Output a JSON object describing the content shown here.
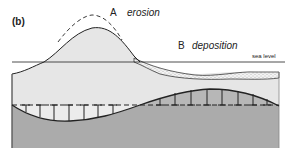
{
  "figure": {
    "panel_label": "(b)",
    "labels": {
      "A": {
        "letter": "A",
        "process": "erosion"
      },
      "B": {
        "letter": "B",
        "process": "deposition"
      },
      "sea_level": "sea level"
    },
    "colors": {
      "land_fill": "#e8e8e8",
      "lower_layer": "#a9a9a9",
      "sediment": "#f2f2f2",
      "lines": "#222222",
      "light_lens": "#ececec"
    },
    "elements": [
      "original hill profile (dashed)",
      "eroded hill profile (solid)",
      "sea level line",
      "deposited sediment wedge (stippled)",
      "horizontal dashed reference line with vertical ticks",
      "curved boundary surface",
      "lower dark layer"
    ]
  }
}
